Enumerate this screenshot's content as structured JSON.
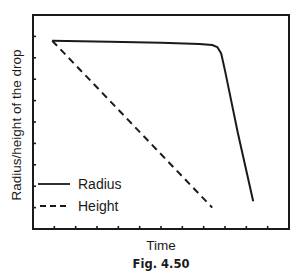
{
  "chart_data": {
    "type": "line",
    "title": "",
    "caption": "Fig. 4.50",
    "xlabel": "Time",
    "ylabel": "Radius/height of the drop",
    "xlim": [
      0,
      1
    ],
    "ylim": [
      0,
      1
    ],
    "x_ticks_count": 12,
    "y_ticks_count": 10,
    "tick_labels_shown": false,
    "grid": false,
    "legend": {
      "placement": "bottom-left",
      "entries": [
        {
          "name": "Radius",
          "style": "solid"
        },
        {
          "name": "Height",
          "style": "dashed"
        }
      ]
    },
    "series": [
      {
        "name": "Radius",
        "style": "solid",
        "color": "#1a1a1a",
        "x": [
          0.075,
          0.3,
          0.5,
          0.65,
          0.7,
          0.72,
          0.735,
          0.75,
          0.8,
          0.86
        ],
        "y": [
          0.88,
          0.875,
          0.87,
          0.865,
          0.86,
          0.85,
          0.82,
          0.74,
          0.45,
          0.13
        ]
      },
      {
        "name": "Height",
        "style": "dashed",
        "color": "#1a1a1a",
        "x": [
          0.075,
          0.7
        ],
        "y": [
          0.88,
          0.1
        ]
      }
    ]
  }
}
